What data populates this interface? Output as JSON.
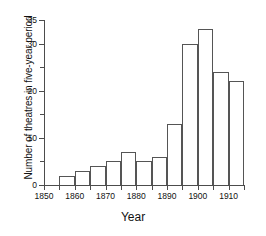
{
  "chart_data": {
    "type": "bar",
    "title": "",
    "xlabel": "Year",
    "ylabel": "Number of theatres in five-year period",
    "categories": [
      "1855-1860",
      "1860-1865",
      "1865-1870",
      "1870-1875",
      "1875-1880",
      "1880-1885",
      "1885-1890",
      "1890-1895",
      "1895-1900",
      "1900-1905",
      "1905-1910",
      "1910-1915"
    ],
    "bin_starts": [
      1855,
      1860,
      1865,
      1870,
      1875,
      1880,
      1885,
      1890,
      1895,
      1900,
      1905,
      1910
    ],
    "bin_width": 5,
    "values": [
      2,
      3,
      4,
      5,
      7,
      5,
      6,
      13,
      30,
      33,
      24,
      22
    ],
    "xlim": [
      1850,
      1915
    ],
    "ylim": [
      0,
      35
    ],
    "x_ticks": [
      1850,
      1860,
      1870,
      1880,
      1890,
      1900,
      1910
    ],
    "x_tick_labels": [
      "1850",
      "1860",
      "1870",
      "1880",
      "1890",
      "1900",
      "1910"
    ],
    "x_minor_ticks": [
      1855,
      1865,
      1875,
      1885,
      1895,
      1905,
      1915
    ],
    "y_ticks": [
      0,
      10,
      20,
      30,
      35
    ],
    "y_tick_labels": [
      "0",
      "10",
      "20",
      "30",
      "35"
    ],
    "y_minor_ticks": [
      5,
      15,
      25
    ],
    "grid": false,
    "legend": false,
    "bar_edge_color": "#555555",
    "bar_fill_color": "#ffffff",
    "axis_color": "#4c4c4c"
  },
  "axis_titles": {
    "x": "Year",
    "y": "Number of theatres in five-year period"
  }
}
